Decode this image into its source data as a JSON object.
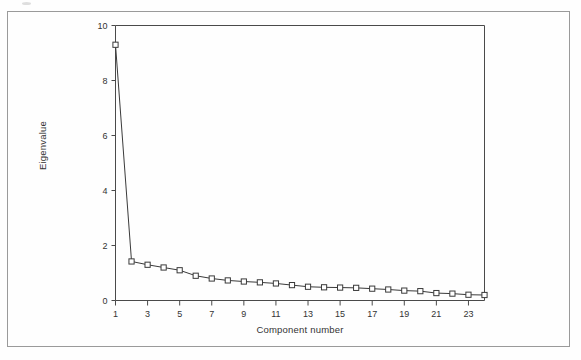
{
  "figure": {
    "border_color": "#9a9a9a",
    "background": "#fefefe"
  },
  "chart_data": {
    "type": "line",
    "title": "",
    "xlabel": "Component number",
    "ylabel": "Eigenvalue",
    "xlim": [
      1,
      24
    ],
    "ylim": [
      0,
      10
    ],
    "grid": false,
    "legend": null,
    "marker": "open-square",
    "line_color": "#3a3a3a",
    "marker_color": "#3a3a3a",
    "x": [
      1,
      2,
      3,
      4,
      5,
      6,
      7,
      8,
      9,
      10,
      11,
      12,
      13,
      14,
      15,
      16,
      17,
      18,
      19,
      20,
      21,
      22,
      23,
      24
    ],
    "values": [
      9.3,
      1.42,
      1.3,
      1.2,
      1.1,
      0.9,
      0.8,
      0.73,
      0.69,
      0.66,
      0.62,
      0.56,
      0.5,
      0.48,
      0.47,
      0.46,
      0.43,
      0.4,
      0.36,
      0.34,
      0.27,
      0.25,
      0.21,
      0.2
    ],
    "xticks": [
      1,
      3,
      5,
      7,
      9,
      11,
      13,
      15,
      17,
      19,
      21,
      23
    ],
    "xticklabels": [
      "1",
      "3",
      "5",
      "7",
      "9",
      "11",
      "13",
      "15",
      "17",
      "19",
      "21",
      "23"
    ],
    "yticks": [
      0,
      2,
      4,
      6,
      8,
      10
    ],
    "yticklabels": [
      "0",
      "2",
      "4",
      "6",
      "8",
      "10"
    ]
  }
}
